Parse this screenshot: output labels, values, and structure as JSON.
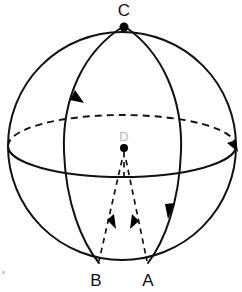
{
  "figure": {
    "background_color": "#ffffff",
    "ink_color": "#111111",
    "faint_label_color": "#b9b9b9"
  },
  "labels": {
    "top_pole": "C",
    "center": "D",
    "bottom_left": "B",
    "bottom_right": "A"
  },
  "points": [
    {
      "name": "C",
      "label": "C",
      "x": 124,
      "y": 26,
      "kind": "pole",
      "marker": "filled-dot",
      "label_x": 124,
      "label_y": 16
    },
    {
      "name": "D",
      "label": "D",
      "x": 124,
      "y": 148,
      "kind": "center",
      "marker": "filled-dot",
      "label_x": 124,
      "label_y": 141
    },
    {
      "name": "B",
      "label": "B",
      "x": 99,
      "y": 263,
      "kind": "surface",
      "marker": "none",
      "label_x": 96,
      "label_y": 285
    },
    {
      "name": "A",
      "label": "A",
      "x": 148,
      "y": 263,
      "kind": "surface",
      "marker": "none",
      "label_x": 148,
      "label_y": 285
    }
  ],
  "shapes": {
    "sphere_outline": {
      "name": "sphere-outline",
      "type": "circle",
      "cx": 122,
      "cy": 146,
      "r": 114,
      "style": "solid"
    },
    "equator": {
      "name": "equator-ellipse",
      "type": "ellipse",
      "cx": 122,
      "cy": 146,
      "rx": 114,
      "ry": 31,
      "back_half_style": "dashed",
      "front_half_style": "solid"
    },
    "meridian_left": {
      "name": "meridian-arc-C-to-B",
      "type": "arc",
      "from": "C",
      "to": "B",
      "style": "solid",
      "bulge": "left"
    },
    "meridian_right": {
      "name": "meridian-arc-C-to-A",
      "type": "arc",
      "from": "C",
      "to": "A",
      "style": "solid",
      "bulge": "right"
    },
    "radius_DB": {
      "name": "radius-D-to-B",
      "type": "line",
      "from": "D",
      "to": "B",
      "style": "dashed"
    },
    "radius_DA": {
      "name": "radius-D-to-A",
      "type": "line",
      "from": "D",
      "to": "A",
      "style": "dashed"
    },
    "axis_stub": {
      "name": "axis-stub-below-D",
      "type": "line",
      "style": "dashed"
    }
  },
  "arrows": [
    {
      "name": "arrow-meridian-left",
      "on": "meridian_left",
      "x": 80,
      "y": 96,
      "direction": "down-left",
      "angle_deg": 104
    },
    {
      "name": "arrow-meridian-right",
      "on": "meridian_right",
      "x": 170,
      "y": 212,
      "direction": "down-left",
      "angle_deg": 101
    },
    {
      "name": "arrow-equator-right",
      "on": "equator",
      "x": 234,
      "y": 146,
      "direction": "down-right",
      "angle_deg": 55
    },
    {
      "name": "arrow-radius-DB",
      "on": "radius_DB",
      "x": 112,
      "y": 222,
      "direction": "up-right",
      "angle_deg": -72
    },
    {
      "name": "arrow-radius-DA",
      "on": "radius_DA",
      "x": 135,
      "y": 222,
      "direction": "up-left",
      "angle_deg": -108
    }
  ]
}
